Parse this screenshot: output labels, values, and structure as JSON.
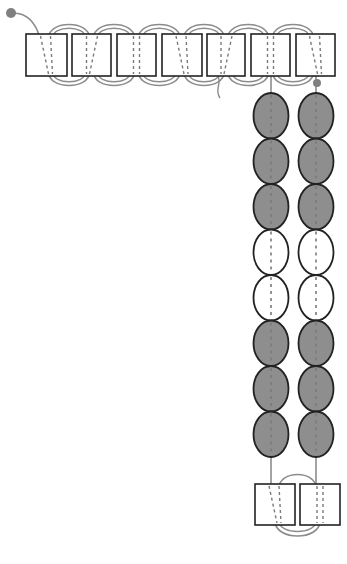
{
  "diagram": {
    "title": "",
    "type": "beading-pattern",
    "colors": {
      "outline": "#222222",
      "thread": "#8c8c8c",
      "thread_dash": "#7a7a7a",
      "bead_dark": "#8e8e8e",
      "bead_light": "#ffffff",
      "knot": "#808080"
    },
    "top_row": {
      "box_count": 7,
      "boxes": [
        {
          "x": 26,
          "y": 34,
          "w": 41,
          "h": 42
        },
        {
          "x": 72,
          "y": 34,
          "w": 39,
          "h": 42
        },
        {
          "x": 117,
          "y": 34,
          "w": 39,
          "h": 42
        },
        {
          "x": 162,
          "y": 34,
          "w": 40,
          "h": 42
        },
        {
          "x": 207,
          "y": 34,
          "w": 38,
          "h": 42
        },
        {
          "x": 251,
          "y": 34,
          "w": 39,
          "h": 42
        },
        {
          "x": 296,
          "y": 34,
          "w": 39,
          "h": 42
        }
      ]
    },
    "columns": [
      {
        "name": "left-column",
        "cx": 271,
        "beads": [
          "dark",
          "dark",
          "dark",
          "light",
          "light",
          "dark",
          "dark",
          "dark"
        ]
      },
      {
        "name": "right-column",
        "cx": 316,
        "beads": [
          "dark",
          "dark",
          "dark",
          "light",
          "light",
          "dark",
          "dark",
          "dark"
        ]
      }
    ],
    "bead_geometry": {
      "top": 93,
      "height": 45.5,
      "rx": 17.5
    },
    "bottom_row": {
      "boxes": [
        {
          "x": 255,
          "y": 484,
          "w": 40,
          "h": 41
        },
        {
          "x": 300,
          "y": 484,
          "w": 40,
          "h": 41
        }
      ]
    },
    "knots": [
      {
        "name": "start-knot",
        "cx": 11,
        "cy": 13,
        "r": 5
      },
      {
        "name": "end-knot",
        "cx": 317,
        "cy": 83,
        "r": 4
      }
    ]
  }
}
